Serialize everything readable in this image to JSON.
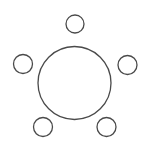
{
  "diagram": {
    "stroke_color": "#4a4a4a",
    "fill_color": "#ffffff",
    "table": {
      "cx": 74.5,
      "cy": 83,
      "r": 36.5
    },
    "seats": [
      {
        "name": "seat-top",
        "cx": 75,
        "cy": 24,
        "r": 9
      },
      {
        "name": "seat-left",
        "cx": 23,
        "cy": 64,
        "r": 9.5
      },
      {
        "name": "seat-right",
        "cx": 127.5,
        "cy": 65,
        "r": 9.5
      },
      {
        "name": "seat-bottom-left",
        "cx": 43,
        "cy": 127,
        "r": 9.5
      },
      {
        "name": "seat-bottom-right",
        "cx": 106.5,
        "cy": 127,
        "r": 9.5
      }
    ]
  }
}
